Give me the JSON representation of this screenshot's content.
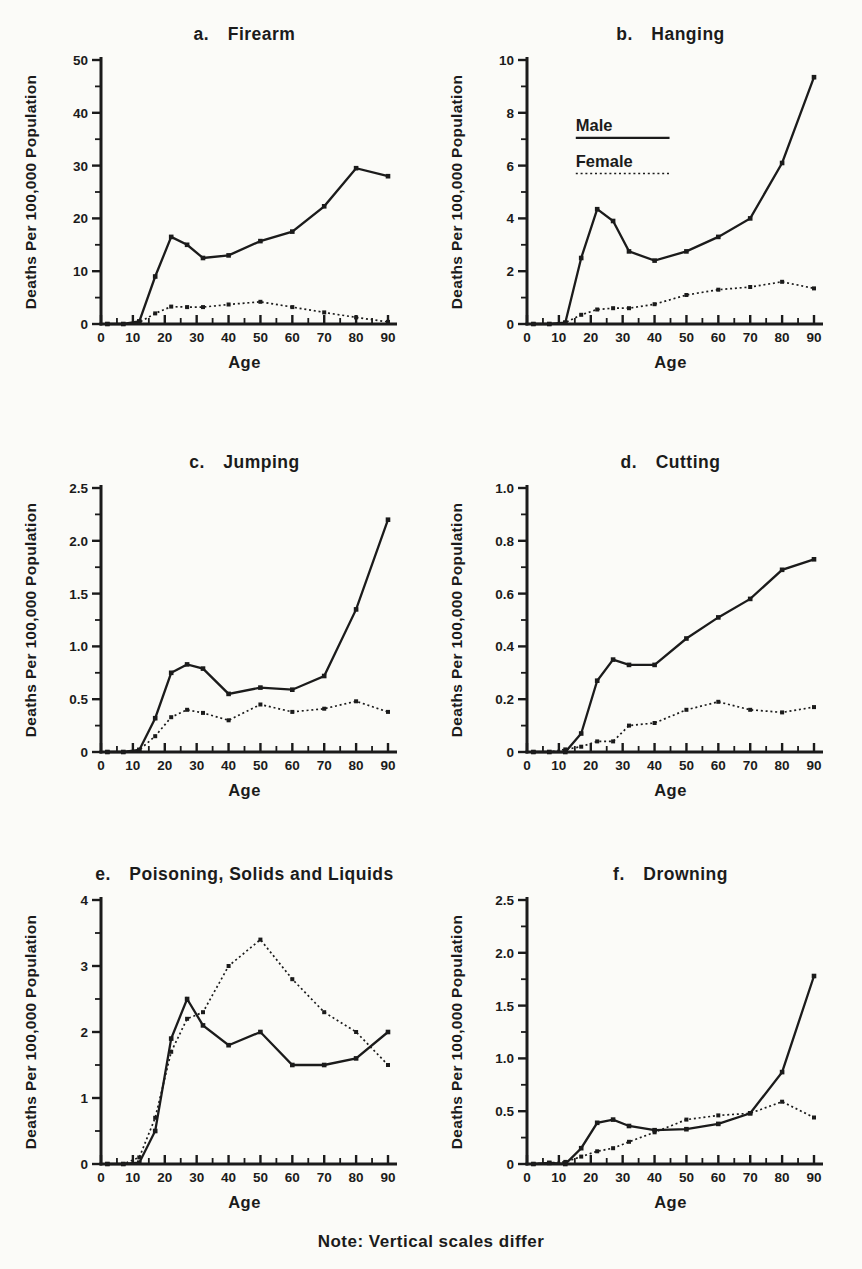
{
  "page": {
    "background": "#fbfbf8",
    "ink": "#1b1b1b",
    "page_number_partial": "99",
    "note": "Note: Vertical scales differ"
  },
  "axes_shared": {
    "xlabel": "Age",
    "ylabel": "Deaths Per 100,000 Population",
    "x": [
      2,
      7,
      12,
      17,
      22,
      27,
      32,
      40,
      50,
      60,
      70,
      80,
      90
    ],
    "xlim": [
      0,
      93
    ],
    "xticks": [
      0,
      10,
      20,
      30,
      40,
      50,
      60,
      70,
      80,
      90
    ],
    "xtick_labels": [
      "0",
      "10",
      "20",
      "30",
      "40",
      "50",
      "60",
      "70",
      "80",
      "90"
    ],
    "xminor_step": 5,
    "grid": false
  },
  "legend": {
    "male_label": "Male",
    "female_label": "Female",
    "male_style": "solid",
    "female_style": "dotted",
    "location": "inside chart b, upper left"
  },
  "chart_data": [
    {
      "id": "a",
      "type": "line",
      "label_letter": "a.",
      "title": "Firearm",
      "ylim": [
        0,
        50
      ],
      "yticks": [
        0,
        10,
        20,
        30,
        40,
        50
      ],
      "ytick_labels": [
        "0",
        "10",
        "20",
        "30",
        "40",
        "50"
      ],
      "legend": false,
      "series": [
        {
          "name": "Male",
          "style": "solid",
          "values": [
            0,
            0,
            0.5,
            9,
            16.5,
            15,
            12.5,
            13,
            15.7,
            17.5,
            22.3,
            29.5,
            28
          ]
        },
        {
          "name": "Female",
          "style": "dotted",
          "values": [
            0,
            0,
            0.3,
            2,
            3.3,
            3.2,
            3.2,
            3.7,
            4.2,
            3.2,
            2.2,
            1.25,
            0.4
          ]
        }
      ]
    },
    {
      "id": "b",
      "type": "line",
      "label_letter": "b.",
      "title": "Hanging",
      "ylim": [
        0,
        10
      ],
      "yticks": [
        0,
        2,
        4,
        6,
        8,
        10
      ],
      "ytick_labels": [
        "0",
        "2",
        "4",
        "6",
        "8",
        "10"
      ],
      "legend": true,
      "series": [
        {
          "name": "Male",
          "style": "solid",
          "values": [
            0,
            0,
            0.05,
            2.5,
            4.35,
            3.9,
            2.75,
            2.4,
            2.75,
            3.3,
            4.0,
            6.1,
            9.35
          ]
        },
        {
          "name": "Female",
          "style": "dotted",
          "values": [
            0,
            0,
            0.05,
            0.35,
            0.55,
            0.6,
            0.6,
            0.75,
            1.1,
            1.3,
            1.4,
            1.6,
            1.35
          ]
        }
      ]
    },
    {
      "id": "c",
      "type": "line",
      "label_letter": "c.",
      "title": "Jumping",
      "ylim": [
        0,
        2.5
      ],
      "yticks": [
        0,
        0.5,
        1.0,
        1.5,
        2.0,
        2.5
      ],
      "ytick_labels": [
        "0",
        "0.5",
        "1.0",
        "1.5",
        "2.0",
        "2.5"
      ],
      "legend": false,
      "series": [
        {
          "name": "Male",
          "style": "solid",
          "values": [
            0,
            0,
            0.02,
            0.32,
            0.75,
            0.83,
            0.79,
            0.55,
            0.61,
            0.59,
            0.72,
            1.35,
            2.2
          ]
        },
        {
          "name": "Female",
          "style": "dotted",
          "values": [
            0,
            0,
            0.02,
            0.15,
            0.33,
            0.4,
            0.37,
            0.3,
            0.45,
            0.38,
            0.41,
            0.48,
            0.38
          ]
        }
      ]
    },
    {
      "id": "d",
      "type": "line",
      "label_letter": "d.",
      "title": "Cutting",
      "ylim": [
        0,
        1.0
      ],
      "yticks": [
        0,
        0.2,
        0.4,
        0.6,
        0.8,
        1.0
      ],
      "ytick_labels": [
        "0",
        "0.2",
        "0.4",
        "0.6",
        "0.8",
        "1.0"
      ],
      "legend": false,
      "series": [
        {
          "name": "Male",
          "style": "solid",
          "values": [
            0,
            0,
            0,
            0.07,
            0.27,
            0.35,
            0.33,
            0.33,
            0.43,
            0.51,
            0.58,
            0.69,
            0.73
          ]
        },
        {
          "name": "Female",
          "style": "dotted",
          "values": [
            0,
            0,
            0.01,
            0.02,
            0.04,
            0.04,
            0.1,
            0.11,
            0.16,
            0.19,
            0.16,
            0.15,
            0.17
          ]
        }
      ]
    },
    {
      "id": "e",
      "type": "line",
      "label_letter": "e.",
      "title": "Poisoning, Solids and Liquids",
      "ylim": [
        0,
        4
      ],
      "yticks": [
        0,
        1,
        2,
        3,
        4
      ],
      "ytick_labels": [
        "0",
        "1",
        "2",
        "3",
        "4"
      ],
      "legend": false,
      "series": [
        {
          "name": "Male",
          "style": "solid",
          "values": [
            0,
            0,
            0.02,
            0.5,
            1.9,
            2.5,
            2.1,
            1.8,
            2.0,
            1.5,
            1.5,
            1.6,
            2.0
          ]
        },
        {
          "name": "Female",
          "style": "dotted",
          "values": [
            0,
            0,
            0.1,
            0.7,
            1.7,
            2.2,
            2.3,
            3.0,
            3.4,
            2.8,
            2.3,
            2.0,
            1.5
          ]
        }
      ]
    },
    {
      "id": "f",
      "type": "line",
      "label_letter": "f.",
      "title": "Drowning",
      "ylim": [
        0,
        2.5
      ],
      "yticks": [
        0,
        0.5,
        1.0,
        1.5,
        2.0,
        2.5
      ],
      "ytick_labels": [
        "0",
        "0.5",
        "1.0",
        "1.5",
        "2.0",
        "2.5"
      ],
      "legend": false,
      "series": [
        {
          "name": "Male",
          "style": "solid",
          "values": [
            0,
            0.01,
            0,
            0.15,
            0.39,
            0.42,
            0.36,
            0.32,
            0.33,
            0.38,
            0.48,
            0.87,
            1.78
          ]
        },
        {
          "name": "Female",
          "style": "dotted",
          "values": [
            0,
            0.01,
            0.02,
            0.07,
            0.12,
            0.15,
            0.21,
            0.3,
            0.42,
            0.46,
            0.48,
            0.59,
            0.44
          ]
        }
      ]
    }
  ]
}
